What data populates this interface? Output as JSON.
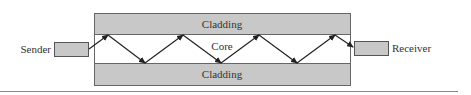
{
  "diagram": {
    "sender": {
      "label": "Sender"
    },
    "receiver": {
      "label": "Receiver"
    },
    "fiber": {
      "top_cladding_label": "Cladding",
      "core_label": "Core",
      "bottom_cladding_label": "Cladding"
    },
    "colors": {
      "cladding_fill": "#c8c8c8",
      "box_fill": "#c8c8c8",
      "stroke": "#555555",
      "ray": "#222222",
      "text": "#333333",
      "rule": "#888888"
    }
  }
}
